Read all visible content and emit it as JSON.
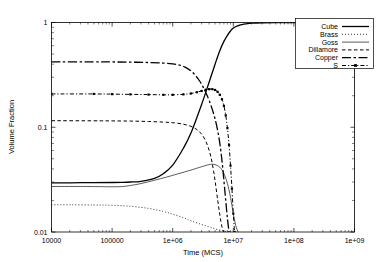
{
  "chart_data": {
    "type": "line",
    "title": "",
    "xlabel": "Time (MCS)",
    "ylabel": "Volume Fraction",
    "xscale": "log",
    "yscale": "log",
    "xlim": [
      10000,
      1000000000
    ],
    "ylim": [
      0.01,
      1
    ],
    "grid": false,
    "legend_position": "top-right",
    "xticks": [
      "10000",
      "100000",
      "1e+06",
      "1e+07",
      "1e+08",
      "1e+09"
    ],
    "xtick_values": [
      10000,
      100000,
      1000000,
      10000000,
      100000000,
      1000000000
    ],
    "yticks": [
      "1",
      "0.1",
      "0.01"
    ],
    "ytick_values": [
      1,
      0.1,
      0.01
    ],
    "series": [
      {
        "name": "Cube",
        "style": "solid",
        "width": 1.3,
        "x": [
          10000,
          20000,
          50000,
          100000,
          150000,
          200000,
          300000,
          500000,
          700000,
          1000000,
          1500000,
          2000000,
          3000000,
          4000000,
          5000000,
          6000000,
          7000000,
          8000000,
          9000000,
          10000000,
          12000000,
          15000000,
          20000000,
          30000000,
          50000000,
          100000000,
          300000000,
          1000000000
        ],
        "y": [
          0.0295,
          0.0295,
          0.0296,
          0.0297,
          0.0298,
          0.03,
          0.0305,
          0.0325,
          0.036,
          0.0435,
          0.063,
          0.088,
          0.165,
          0.27,
          0.4,
          0.54,
          0.66,
          0.755,
          0.83,
          0.885,
          0.935,
          0.965,
          0.985,
          0.995,
          0.999,
          1.0,
          1.0,
          1.0
        ]
      },
      {
        "name": "Brass",
        "style": "dotted",
        "width": 0.8,
        "x": [
          10000,
          20000,
          50000,
          100000,
          200000,
          400000,
          700000,
          1000000,
          1500000,
          2000000,
          3000000,
          4000000,
          5000000,
          6000000,
          7000000,
          8000000,
          9000000
        ],
        "y": [
          0.0182,
          0.0182,
          0.0181,
          0.018,
          0.0176,
          0.0168,
          0.0157,
          0.0148,
          0.0137,
          0.0128,
          0.0118,
          0.0112,
          0.0107,
          0.0104,
          0.0102,
          0.0101,
          0.01
        ]
      },
      {
        "name": "Goss",
        "style": "solid",
        "width": 0.65,
        "x": [
          10000,
          30000,
          70000,
          100000,
          150000,
          200000,
          300000,
          500000,
          800000,
          1200000,
          2000000,
          3000000,
          4000000,
          4500000,
          5000000,
          5500000,
          6000000,
          6500000,
          7000000,
          8000000,
          9000000,
          10000000,
          11000000,
          12000000
        ],
        "y": [
          0.0272,
          0.0272,
          0.0271,
          0.027,
          0.0272,
          0.0278,
          0.029,
          0.0312,
          0.0335,
          0.0358,
          0.039,
          0.042,
          0.044,
          0.0443,
          0.044,
          0.043,
          0.0415,
          0.0392,
          0.0362,
          0.029,
          0.0215,
          0.015,
          0.0115,
          0.01
        ]
      },
      {
        "name": "Dillamore",
        "style": "dashed",
        "width": 1.0,
        "x": [
          10000,
          50000,
          100000,
          200000,
          400000,
          700000,
          1000000,
          1500000,
          2000000,
          2500000,
          3000000,
          3500000,
          4000000,
          4500000,
          5000000,
          5500000,
          6000000,
          6500000,
          7000000
        ],
        "y": [
          0.1155,
          0.1152,
          0.115,
          0.1145,
          0.1135,
          0.112,
          0.1105,
          0.107,
          0.102,
          0.095,
          0.086,
          0.074,
          0.06,
          0.045,
          0.031,
          0.0205,
          0.0145,
          0.0112,
          0.01
        ]
      },
      {
        "name": "Copper",
        "style": "long-dash-dot",
        "width": 1.3,
        "x": [
          10000,
          50000,
          100000,
          200000,
          400000,
          700000,
          1000000,
          1300000,
          1600000,
          2000000,
          2400000,
          2800000,
          3200000,
          3600000,
          4000000,
          4500000,
          5000000,
          5500000,
          6000000,
          6500000,
          7000000,
          7500000,
          8000000,
          8500000
        ],
        "y": [
          0.42,
          0.42,
          0.42,
          0.418,
          0.415,
          0.41,
          0.403,
          0.392,
          0.375,
          0.345,
          0.31,
          0.275,
          0.24,
          0.208,
          0.18,
          0.148,
          0.12,
          0.094,
          0.07,
          0.048,
          0.031,
          0.02,
          0.0135,
          0.01
        ]
      },
      {
        "name": "S",
        "style": "dash-dot-marker",
        "width": 1.0,
        "x": [
          10000,
          50000,
          100000,
          200000,
          400000,
          700000,
          1000000,
          1500000,
          2000000,
          2500000,
          3000000,
          3500000,
          4000000,
          4500000,
          5000000,
          5500000,
          6000000,
          6500000,
          7000000,
          7500000,
          8000000,
          8500000,
          9000000,
          9500000,
          10000000,
          10500000
        ],
        "y": [
          0.208,
          0.208,
          0.207,
          0.206,
          0.205,
          0.204,
          0.204,
          0.206,
          0.21,
          0.216,
          0.222,
          0.228,
          0.231,
          0.231,
          0.227,
          0.218,
          0.204,
          0.185,
          0.16,
          0.13,
          0.098,
          0.068,
          0.043,
          0.026,
          0.015,
          0.01
        ]
      }
    ]
  },
  "legend": {
    "entries": [
      {
        "label": "Cube"
      },
      {
        "label": "Brass"
      },
      {
        "label": "Goss"
      },
      {
        "label": "Dillamore"
      },
      {
        "label": "Copper"
      },
      {
        "label": "S"
      }
    ]
  },
  "colors": {
    "foreground": "#000000",
    "background": "#ffffff"
  }
}
